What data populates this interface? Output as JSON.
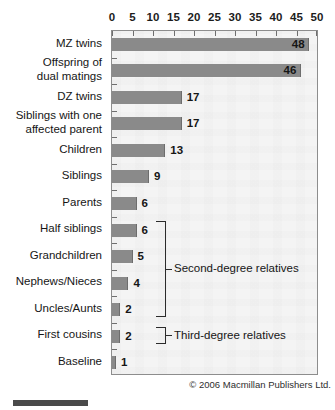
{
  "chart_data": {
    "type": "bar",
    "orientation": "horizontal",
    "title": "",
    "subtitle": "",
    "xlabel": "",
    "ylabel": "",
    "xlim": [
      0,
      50
    ],
    "xticks": [
      0,
      5,
      10,
      15,
      20,
      25,
      30,
      35,
      40,
      45,
      50
    ],
    "xtick_labels": [
      "0",
      "5",
      "10",
      "15",
      "20",
      "25",
      "30",
      "35",
      "40",
      "45",
      "50"
    ],
    "grid": false,
    "legend": null,
    "categories": [
      "MZ twins",
      "Offspring of dual matings",
      "DZ twins",
      "Siblings with one affected parent",
      "Children",
      "Siblings",
      "Parents",
      "Half siblings",
      "Grandchildren",
      "Nephews/Nieces",
      "Uncles/Aunts",
      "First cousins",
      "Baseline"
    ],
    "category_lines": [
      [
        "MZ twins"
      ],
      [
        "Offspring of",
        "dual matings"
      ],
      [
        "DZ twins"
      ],
      [
        "Siblings with one",
        "affected parent"
      ],
      [
        "Children"
      ],
      [
        "Siblings"
      ],
      [
        "Parents"
      ],
      [
        "Half siblings"
      ],
      [
        "Grandchildren"
      ],
      [
        "Nephews/Nieces"
      ],
      [
        "Uncles/Aunts"
      ],
      [
        "First cousins"
      ],
      [
        "Baseline"
      ]
    ],
    "values": [
      48,
      46,
      17,
      17,
      13,
      9,
      6,
      6,
      5,
      4,
      2,
      2,
      1
    ],
    "value_labels": [
      "48",
      "46",
      "17",
      "17",
      "13",
      "9",
      "6",
      "6",
      "5",
      "4",
      "2",
      "2",
      "1"
    ],
    "bar_color": "#8a8a8a",
    "plot_background": "#f2f2f2",
    "annotations": [
      {
        "label": "Second-degree relatives",
        "spans_categories": [
          "Half siblings",
          "Grandchildren",
          "Nephews/Nieces",
          "Uncles/Aunts"
        ],
        "start_index": 7,
        "end_index": 10
      },
      {
        "label": "Third-degree relatives",
        "spans_categories": [
          "First cousins"
        ],
        "start_index": 11,
        "end_index": 11
      }
    ]
  },
  "footer": {
    "copyright": "© 2006 Macmillan Publishers Ltd."
  }
}
